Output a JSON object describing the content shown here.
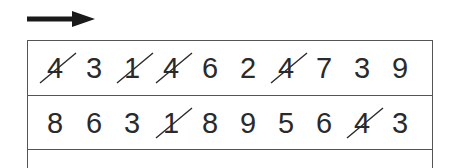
{
  "direction_arrow": "right-arrow",
  "rows": [
    {
      "digits": [
        {
          "value": "4",
          "crossed": true
        },
        {
          "value": "3",
          "crossed": false
        },
        {
          "value": "1",
          "crossed": true
        },
        {
          "value": "4",
          "crossed": true
        },
        {
          "value": "6",
          "crossed": false
        },
        {
          "value": "2",
          "crossed": false
        },
        {
          "value": "4",
          "crossed": true
        },
        {
          "value": "7",
          "crossed": false
        },
        {
          "value": "3",
          "crossed": false
        },
        {
          "value": "9",
          "crossed": false
        }
      ]
    },
    {
      "digits": [
        {
          "value": "8",
          "crossed": false
        },
        {
          "value": "6",
          "crossed": false
        },
        {
          "value": "3",
          "crossed": false
        },
        {
          "value": "1",
          "crossed": true
        },
        {
          "value": "8",
          "crossed": false
        },
        {
          "value": "9",
          "crossed": false
        },
        {
          "value": "5",
          "crossed": false
        },
        {
          "value": "6",
          "crossed": false
        },
        {
          "value": "4",
          "crossed": true
        },
        {
          "value": "3",
          "crossed": false
        }
      ]
    }
  ],
  "colors": {
    "ink": "#2a2a2a",
    "border": "#555555",
    "arrow": "#1a1a1a"
  }
}
